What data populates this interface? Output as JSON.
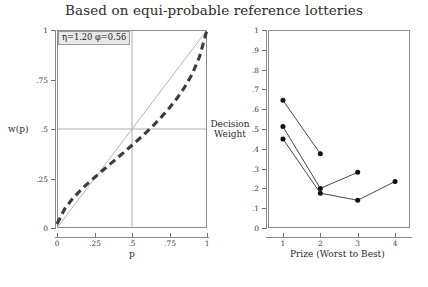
{
  "title": "Based on equi-probable reference lotteries",
  "annotation": {
    "text": "η=1.20 φ=0.56"
  },
  "footer": {
    "text": ""
  },
  "left_panel": {
    "ylabel": "w(p)",
    "xlabel": "p",
    "yticks": [
      "1",
      ".75",
      ".5",
      ".25",
      "0"
    ],
    "xticks": [
      "0",
      ".25",
      ".5",
      ".75",
      "1"
    ]
  },
  "right_panel": {
    "ylabel_line1": "Decision",
    "ylabel_line2": "Weight",
    "xlabel": "Prize (Worst to Best)",
    "yticks": [
      "1",
      ".9",
      ".8",
      ".7",
      ".6",
      ".5",
      ".4",
      ".3",
      ".2",
      ".1",
      "0"
    ],
    "xticks": [
      "1",
      "2",
      "3",
      "4"
    ]
  },
  "chart_data": [
    {
      "type": "line",
      "id": "weighting-function",
      "title": "Based on equi-probable reference lotteries",
      "xlabel": "p",
      "ylabel": "w(p)",
      "xlim": [
        0,
        1
      ],
      "ylim": [
        0,
        1
      ],
      "xticks": [
        0,
        0.25,
        0.5,
        0.75,
        1
      ],
      "xtick_labels": [
        "0",
        ".25",
        ".5",
        ".75",
        "1"
      ],
      "yticks": [
        0,
        0.25,
        0.5,
        0.75,
        1
      ],
      "ytick_labels": [
        "0",
        ".25",
        ".5",
        ".75",
        "1"
      ],
      "grid": true,
      "grid_lines": {
        "vertical_at": [
          0.5
        ],
        "horizontal_at": [
          0.5
        ]
      },
      "legend": null,
      "annotations": [
        {
          "text": "η=1.20 φ=0.56",
          "x": 0.03,
          "y": 0.97
        }
      ],
      "series": [
        {
          "name": "identity (45-degree reference line)",
          "style": "solid",
          "color": "#b0b0b0",
          "x": [
            0,
            1
          ],
          "values": [
            0,
            1
          ]
        },
        {
          "name": "w(p) weighting function",
          "style": "dashed",
          "color": "#3c3c3c",
          "x": [
            0.0,
            0.05,
            0.1,
            0.15,
            0.2,
            0.25,
            0.3,
            0.35,
            0.4,
            0.45,
            0.5,
            0.55,
            0.6,
            0.65,
            0.7,
            0.75,
            0.8,
            0.85,
            0.9,
            0.95,
            1.0
          ],
          "values": [
            0.02,
            0.095,
            0.145,
            0.185,
            0.222,
            0.255,
            0.288,
            0.32,
            0.352,
            0.385,
            0.418,
            0.452,
            0.487,
            0.524,
            0.564,
            0.607,
            0.655,
            0.71,
            0.775,
            0.865,
            1.0
          ]
        }
      ]
    },
    {
      "type": "line",
      "id": "decision-weights-by-prize",
      "xlabel": "Prize (Worst to Best)",
      "ylabel": "Decision Weight",
      "xlim": [
        0.6,
        4.4
      ],
      "ylim": [
        0,
        1
      ],
      "xticks": [
        1,
        2,
        3,
        4
      ],
      "xtick_labels": [
        "1",
        "2",
        "3",
        "4"
      ],
      "yticks": [
        0,
        0.1,
        0.2,
        0.3,
        0.4,
        0.5,
        0.6,
        0.7,
        0.8,
        0.9,
        1
      ],
      "ytick_labels": [
        "0",
        ".1",
        ".2",
        ".3",
        ".4",
        ".5",
        ".6",
        ".7",
        ".8",
        ".9",
        "1"
      ],
      "grid": false,
      "legend": null,
      "marker": "filled-circle",
      "series": [
        {
          "name": "two-prize lottery",
          "x": [
            1,
            2
          ],
          "values": [
            0.645,
            0.375
          ]
        },
        {
          "name": "three-prize lottery",
          "x": [
            1,
            2,
            3
          ],
          "values": [
            0.512,
            0.2,
            0.281
          ]
        },
        {
          "name": "four-prize lottery",
          "x": [
            1,
            2,
            3,
            4
          ],
          "values": [
            0.45,
            0.176,
            0.14,
            0.235
          ]
        }
      ]
    }
  ]
}
